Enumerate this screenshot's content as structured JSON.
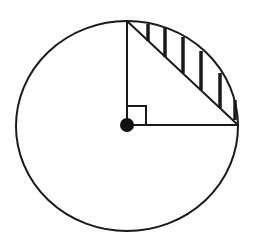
{
  "diagram": {
    "colors": {
      "stroke": "#1a1a1a",
      "background": "#ffffff",
      "center_dot": "#111111"
    },
    "circle": {
      "cx": 127,
      "cy": 126,
      "rx": 111,
      "ry": 105
    },
    "center_point": {
      "x": 127,
      "y": 125,
      "r": 7
    },
    "radius_vertical": {
      "x1": 127,
      "y1": 125,
      "x2": 127,
      "y2": 21
    },
    "radius_horizontal": {
      "x1": 127,
      "y1": 125,
      "x2": 238,
      "y2": 125
    },
    "chord": {
      "x1": 127,
      "y1": 21,
      "x2": 238,
      "y2": 125
    },
    "right_angle_marker": {
      "x": 127,
      "y": 106,
      "size": 19
    },
    "shaded_region": "circular segment between chord and arc",
    "hatch_lines": [
      {
        "x": 148,
        "y1": 24,
        "y2": 41
      },
      {
        "x": 165,
        "y1": 28,
        "y2": 57
      },
      {
        "x": 183,
        "y1": 37,
        "y2": 73
      },
      {
        "x": 201,
        "y1": 51,
        "y2": 90
      },
      {
        "x": 220,
        "y1": 73,
        "y2": 108
      },
      {
        "x": 235,
        "y1": 100,
        "y2": 120
      }
    ]
  }
}
